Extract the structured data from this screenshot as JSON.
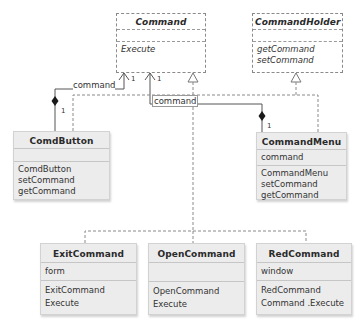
{
  "diagram": {
    "type": "UML class diagram",
    "classes": {
      "command": {
        "name": "Command",
        "kind": "interface",
        "attributes": [],
        "methods": [
          "Execute"
        ]
      },
      "command_holder": {
        "name": "CommandHolder",
        "kind": "interface",
        "attributes": [],
        "methods": [
          "getCommand",
          "setCommand"
        ]
      },
      "comd_button": {
        "name": "ComdButton",
        "kind": "class",
        "attributes": [],
        "methods": [
          "ComdButton",
          "setCommand",
          "getCommand"
        ]
      },
      "command_menu": {
        "name": "CommandMenu",
        "kind": "class",
        "attributes": [
          "command"
        ],
        "methods": [
          "CommandMenu",
          "setCommand",
          "getCommand"
        ]
      },
      "exit_command": {
        "name": "ExitCommand",
        "kind": "class",
        "attributes": [
          "form"
        ],
        "methods": [
          "ExitCommand",
          "Execute"
        ]
      },
      "open_command": {
        "name": "OpenCommand",
        "kind": "class",
        "attributes": [],
        "methods": [
          "OpenCommand",
          "Execute"
        ]
      },
      "red_command": {
        "name": "RedCommand",
        "kind": "class",
        "attributes": [
          "window"
        ],
        "methods": [
          "RedCommand",
          "Command .Execute"
        ]
      }
    },
    "associations": [
      {
        "from": "ComdButton",
        "to": "Command",
        "role": "command",
        "multiplicity_to": "1",
        "multiplicity_from": "1",
        "kind": "composition"
      },
      {
        "from": "CommandMenu",
        "to": "Command",
        "role": "command",
        "multiplicity_to": "1",
        "multiplicity_from": "1",
        "kind": "composition"
      }
    ],
    "realizations": [
      {
        "from": "ComdButton",
        "to": "CommandHolder"
      },
      {
        "from": "CommandMenu",
        "to": "CommandHolder"
      },
      {
        "from": "ExitCommand",
        "to": "Command"
      },
      {
        "from": "OpenCommand",
        "to": "Command"
      },
      {
        "from": "RedCommand",
        "to": "Command"
      }
    ],
    "labels": {
      "assoc_button_role": "command",
      "assoc_menu_role": "command",
      "mult_button_cmd": "1",
      "mult_menu_cmd": "1",
      "mult_button_diamond": "1",
      "mult_menu_diamond": "1"
    },
    "colors": {
      "line": "#555555",
      "dashed_line": "#8a8a8a",
      "class_fill": "#ececec",
      "interface_fill": "#ffffff"
    }
  }
}
